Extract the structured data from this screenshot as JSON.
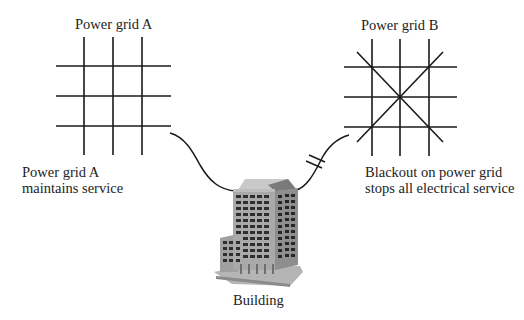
{
  "diagram": {
    "grid_a": {
      "title": "Power grid A",
      "caption_line1": "Power grid A",
      "caption_line2": "maintains service",
      "status": "operational"
    },
    "grid_b": {
      "title": "Power grid B",
      "caption_line1": "Blackout on power grid",
      "caption_line2": "stops all electrical service",
      "status": "blackout"
    },
    "building": {
      "label": "Building"
    },
    "connections": [
      {
        "from": "grid_a",
        "to": "building",
        "state": "connected"
      },
      {
        "from": "grid_b",
        "to": "building",
        "state": "broken"
      }
    ],
    "colors": {
      "line": "#1a1a1a",
      "building_facade": "#a9a9a9",
      "building_side": "#8e8e8e",
      "window": "#2e2e2e",
      "roof_light": "#c9c9c9",
      "roof_dark": "#7a7a7a"
    }
  }
}
